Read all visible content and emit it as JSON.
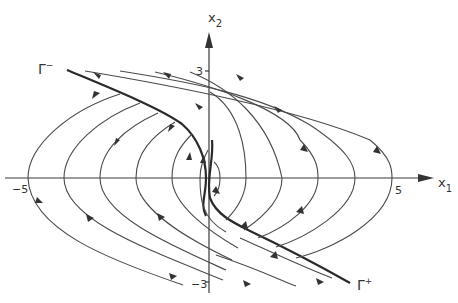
{
  "figure": {
    "type": "phase-portrait",
    "axes": {
      "x_label": "x",
      "x_subscript": "1",
      "y_label": "x",
      "y_subscript": "2",
      "x_ticks": [
        {
          "value": -5,
          "label": "−5"
        },
        {
          "value": 5,
          "label": "5"
        }
      ],
      "y_ticks": [
        {
          "value": 3,
          "label": "3"
        },
        {
          "value": -3,
          "label": "−3"
        }
      ]
    },
    "separatrices": [
      {
        "name": "Gamma-minus",
        "label": "Γ",
        "superscript": "−",
        "position": "upper-left"
      },
      {
        "name": "Gamma-plus",
        "label": "Γ",
        "superscript": "+",
        "position": "lower-right"
      }
    ],
    "trajectory_families": {
      "left": {
        "count": 5,
        "x_axis_crossings": [
          -5,
          -4,
          -3,
          -2,
          -1
        ],
        "direction": "from lower-right, leftward across x-axis, then upward converging onto Γ−"
      },
      "right": {
        "count": 5,
        "x_axis_crossings": [
          1,
          2,
          3,
          4,
          5
        ],
        "direction": "from upper-left, rightward across x-axis, then downward converging onto Γ+"
      }
    }
  }
}
